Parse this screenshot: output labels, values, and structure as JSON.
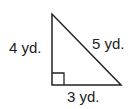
{
  "figure": {
    "type": "right-triangle",
    "labels": {
      "left_leg": "4 yd.",
      "hypotenuse": "5 yd.",
      "bottom_leg": "3 yd."
    },
    "right_angle_marker": true,
    "colors": {
      "stroke": "#222222",
      "background": "#ffffff"
    }
  }
}
